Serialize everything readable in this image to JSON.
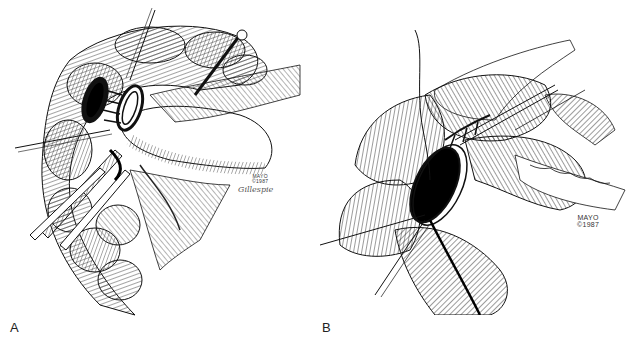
{
  "figure": {
    "panels": [
      {
        "label": "A",
        "credit": {
          "line1": "MAYO",
          "line2": "©1987"
        },
        "signature": "Gillespie",
        "subject": "surgical-illustration-bowel-anastomosis-rings-with-instruments"
      },
      {
        "label": "B",
        "credit": {
          "line1": "MAYO",
          "line2": "©1987"
        },
        "subject": "surgical-illustration-bowel-opening-with-sutures"
      }
    ],
    "colors": {
      "ink": "#111111",
      "background": "#ffffff",
      "label": "#222222"
    }
  }
}
